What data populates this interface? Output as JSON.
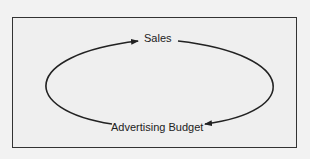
{
  "diagram": {
    "nodes": [
      {
        "id": "sales",
        "label": "Sales"
      },
      {
        "id": "advertising_budget",
        "label": "Advertising Budget"
      }
    ],
    "edges": [
      {
        "from": "advertising_budget",
        "to": "sales",
        "side": "left"
      },
      {
        "from": "sales",
        "to": "advertising_budget",
        "side": "right"
      }
    ],
    "colors": {
      "line": "#222222",
      "background": "#efefef",
      "border": "#333333"
    }
  }
}
